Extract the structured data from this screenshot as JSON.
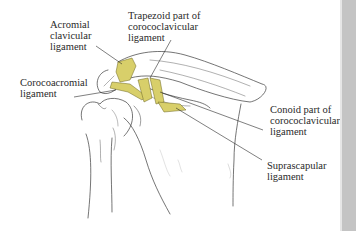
{
  "figure": {
    "ligament_color": "#d8cf6a",
    "line_color": "#3a3a3a",
    "labels": [
      {
        "id": "acromial-clavicular",
        "text": "Acromial\nclavicular\nligament"
      },
      {
        "id": "trapezoid",
        "text": "Trapezoid part of\ncorococlavicular\nligament"
      },
      {
        "id": "corocoacromial",
        "text": "Corocoacromial\nligament"
      },
      {
        "id": "conoid",
        "text": "Conoid part of\ncorococlavicular\nligament"
      },
      {
        "id": "suprascapular",
        "text": "Suprascapular\nligament"
      }
    ]
  },
  "sidebar": {
    "color": "#c4c4c4"
  }
}
